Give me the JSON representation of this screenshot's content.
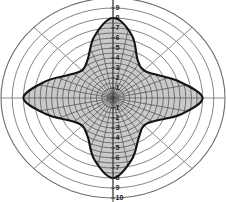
{
  "chart_data": {
    "type": "line",
    "title": "",
    "subtitle": "",
    "xlabel": "",
    "ylabel": "",
    "plot_kind": "polar-radiation-pattern",
    "grid": true,
    "legend": false,
    "radial_axis": {
      "min": 0,
      "max": 10,
      "tick_step": 1,
      "ticks_up": [
        1,
        2,
        3,
        4,
        5,
        6,
        7,
        8,
        9,
        10
      ],
      "ticks_down": [
        1,
        2,
        3,
        4,
        5,
        6,
        7,
        8,
        9,
        10
      ],
      "tick_labels_up": [
        "1",
        "2",
        "3",
        "4",
        "5",
        "6",
        "7",
        "8",
        "9",
        "10"
      ],
      "tick_labels_down": [
        "1",
        "2",
        "3",
        "4",
        "5",
        "6",
        "7",
        "8",
        "9",
        "10"
      ],
      "label_position": "vertical-center-axis"
    },
    "angular_axis": {
      "spoke_count": 8,
      "spoke_angles_deg": [
        0,
        45,
        90,
        135,
        180,
        225,
        270,
        315
      ],
      "grid_ring_values": [
        1,
        2,
        3,
        4,
        5,
        6,
        7,
        8,
        9,
        10
      ]
    },
    "series": [
      {
        "name": "shaded-lobe-pattern",
        "fill": "#c8c8c8",
        "stroke": "#141414",
        "hatch": "cross-hatch",
        "angles_deg": [
          0,
          15,
          30,
          45,
          60,
          75,
          90,
          105,
          120,
          135,
          150,
          165,
          180,
          195,
          210,
          225,
          240,
          255,
          270,
          285,
          300,
          315,
          330,
          345
        ],
        "values": [
          8.0,
          6.2,
          4.6,
          3.9,
          4.4,
          6.5,
          8.0,
          6.4,
          4.5,
          3.9,
          4.6,
          6.3,
          8.0,
          6.2,
          4.5,
          3.9,
          4.5,
          6.4,
          8.0,
          6.4,
          4.6,
          3.9,
          4.5,
          6.3
        ]
      }
    ],
    "annotations": []
  },
  "figure": {
    "caption": "",
    "alt": "Polar radiation pattern with four lobes"
  },
  "colors": {
    "background": "#ffffff",
    "grid_line": "#6e6e6e",
    "spoke_line": "#7a7a7a",
    "lobe_fill": "#c9c9c9",
    "lobe_outline": "#141414",
    "hatch_line": "#4a4a4a",
    "tick_text": "#1a1a1a"
  }
}
